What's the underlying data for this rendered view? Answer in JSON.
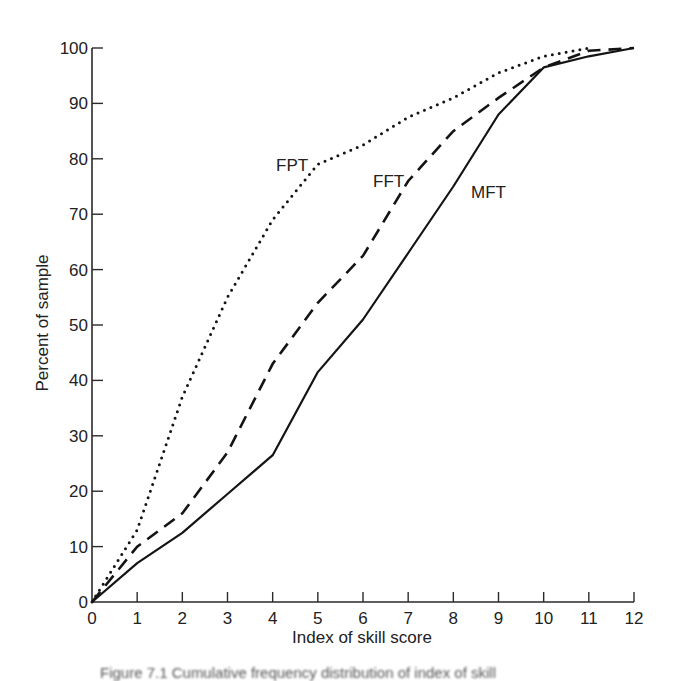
{
  "chart_data": {
    "type": "line",
    "title": "",
    "xlabel": "Index of skill score",
    "ylabel": "Percent of sample",
    "xlim": [
      0,
      12
    ],
    "ylim": [
      0,
      100
    ],
    "x_ticks": [
      0,
      1,
      2,
      3,
      4,
      5,
      6,
      7,
      8,
      9,
      10,
      11,
      12
    ],
    "y_ticks": [
      0,
      10,
      20,
      30,
      40,
      50,
      60,
      70,
      80,
      90,
      100
    ],
    "grid": false,
    "legend": "inline labels",
    "series": [
      {
        "name": "FPT",
        "style": "dotted",
        "x": [
          0,
          1,
          2,
          3,
          4,
          5,
          6,
          7,
          8,
          9,
          10,
          11
        ],
        "values": [
          0,
          13,
          37,
          55,
          69,
          79,
          82.5,
          87.5,
          91,
          95.5,
          98.5,
          100
        ]
      },
      {
        "name": "FFT",
        "style": "dashed",
        "x": [
          0,
          1,
          2,
          3,
          4,
          5,
          6,
          7,
          8,
          9,
          10,
          11,
          12
        ],
        "values": [
          0,
          10,
          16,
          27,
          43,
          54,
          62.5,
          76,
          85,
          91,
          96.5,
          99.5,
          100
        ]
      },
      {
        "name": "MFT",
        "style": "solid",
        "x": [
          0,
          1,
          2,
          3,
          4,
          5,
          6,
          7,
          8,
          9,
          10,
          11,
          12
        ],
        "values": [
          0,
          7,
          12.5,
          19.5,
          26.5,
          41.5,
          51,
          63,
          75,
          88,
          96.5,
          98.5,
          100
        ]
      }
    ],
    "annotations": [
      {
        "text": "FPT",
        "x": 4.3,
        "y": 79
      },
      {
        "text": "FFT",
        "x": 6.3,
        "y": 75
      },
      {
        "text": "MFT",
        "x": 8.5,
        "y": 73
      }
    ]
  },
  "labels": {
    "xlabel": "Index of skill score",
    "ylabel": "Percent of sample",
    "fpt": "FPT",
    "fft": "FFT",
    "mft": "MFT",
    "caption": "Figure 7.1  Cumulative frequency distribution of index of skill"
  }
}
